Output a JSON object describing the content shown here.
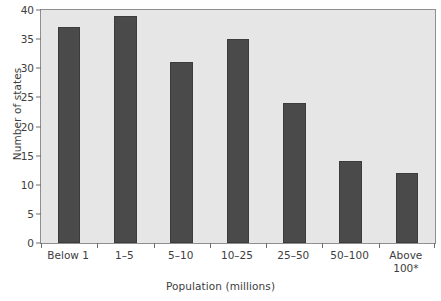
{
  "chart_data": {
    "type": "bar",
    "title": "",
    "xlabel": "Population (millions)",
    "ylabel": "Number of states",
    "categories": [
      "Below 1",
      "1–5",
      "5–10",
      "10–25",
      "25–50",
      "50–100",
      "Above\n100*"
    ],
    "values": [
      37,
      39,
      31,
      35,
      24,
      14,
      12
    ],
    "ylim": [
      0,
      40
    ],
    "ytick_values": [
      0,
      5,
      10,
      15,
      20,
      25,
      30,
      35,
      40
    ],
    "ytick_labels": [
      "0",
      "5",
      "10",
      "15",
      "20",
      "25",
      "30",
      "35",
      "40"
    ],
    "grid": false,
    "legend": "none",
    "colors": {
      "bar_fill": "#4a4a4a",
      "bar_edge": "#3c3c3c",
      "plot_background": "#e6e6e6",
      "plot_border": "#8f8f8f",
      "page_background": "#ffffff",
      "text": "#3d3d3d",
      "tick_mark": "#6e6e6e"
    }
  }
}
